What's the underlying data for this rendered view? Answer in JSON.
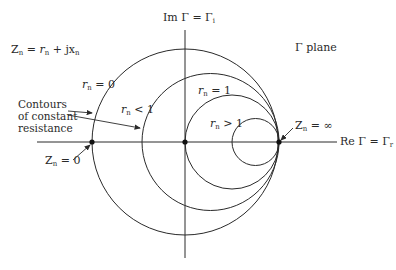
{
  "diagram": {
    "title_fragment": "",
    "impedance_equation": {
      "lhs": "Z",
      "lhs_sub": "n",
      "eq": " = ",
      "r": "r",
      "r_sub": "n",
      "plus": " + j",
      "x": "x",
      "x_sub": "n"
    },
    "imag_axis_label": {
      "pre": "Im Γ = Γ",
      "sub": "i"
    },
    "real_axis_label": {
      "pre": "Re Γ = Γ",
      "sub": "r"
    },
    "plane_label": "Γ plane",
    "contours_note": [
      "Contours",
      "of constant",
      "resistance"
    ],
    "circle_labels": [
      {
        "var": "r",
        "sub": "n",
        "rel": " = 0"
      },
      {
        "var": "r",
        "sub": "n",
        "rel": " < 1"
      },
      {
        "var": "r",
        "sub": "n",
        "rel": " = 1"
      },
      {
        "var": "r",
        "sub": "n",
        "rel": " > 1"
      }
    ],
    "point_labels": {
      "short": {
        "var": "Z",
        "sub": "n",
        "rel": " = 0"
      },
      "open": {
        "var": "Z",
        "sub": "n",
        "rel": " = ∞"
      }
    },
    "colors": {
      "line": "#2a2a2a",
      "background": "#ffffff"
    },
    "geometry": {
      "origin": [
        185,
        142
      ],
      "unit_radius": 93,
      "circles": [
        {
          "cx": 185,
          "cy": 142,
          "r": 93
        },
        {
          "cx": 210.5,
          "cy": 142,
          "r": 68.5
        },
        {
          "cx": 232,
          "cy": 142,
          "r": 47
        },
        {
          "cx": 255.5,
          "cy": 142,
          "r": 23.5
        }
      ]
    }
  }
}
